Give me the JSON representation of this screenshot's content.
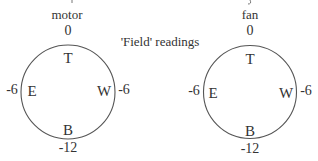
{
  "center_title": "'Field' readings",
  "clipped_top_text": "",
  "colors": {
    "stroke": "#555555",
    "text": "#333333",
    "background": "#ffffff"
  },
  "dials": [
    {
      "name": "motor",
      "positions": {
        "top": "T",
        "east": "E",
        "west": "W",
        "bottom": "B"
      },
      "readings": {
        "top": "0",
        "east": "-6",
        "west": "-6",
        "bottom": "-12"
      }
    },
    {
      "name": "fan",
      "positions": {
        "top": "T",
        "east": "E",
        "west": "W",
        "bottom": "B"
      },
      "readings": {
        "top": "0",
        "east": "-6",
        "west": "-6",
        "bottom": "-12"
      }
    }
  ]
}
